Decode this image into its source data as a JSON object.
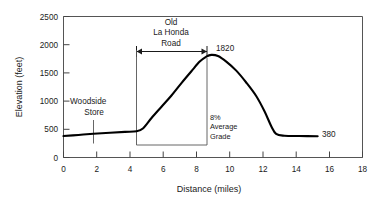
{
  "chart_data": {
    "type": "line",
    "title": "",
    "xlabel": "Distance  (miles)",
    "ylabel": "Elevation  (feet)",
    "xlim": [
      0,
      18
    ],
    "ylim": [
      0,
      2500
    ],
    "xticks": [
      "0",
      "2",
      "4",
      "6",
      "8",
      "10",
      "12",
      "14",
      "16",
      "18"
    ],
    "xtick_values": [
      0,
      2,
      4,
      6,
      8,
      10,
      12,
      14,
      16,
      18
    ],
    "yticks": [
      "0",
      "500",
      "1000",
      "1500",
      "2000",
      "2500"
    ],
    "ytick_values": [
      0,
      500,
      1000,
      1500,
      2000,
      2500
    ],
    "grid": false,
    "legend": "none",
    "series": [
      {
        "name": "Elevation profile",
        "x": [
          0.0,
          0.9,
          1.8,
          2.8,
          3.7,
          4.4,
          4.8,
          5.3,
          5.9,
          6.5,
          7.1,
          7.7,
          8.2,
          8.6,
          8.9,
          9.3,
          9.8,
          10.4,
          11.0,
          11.6,
          12.1,
          12.5,
          12.8,
          13.3,
          14.2,
          15.3
        ],
        "y": [
          380,
          400,
          420,
          440,
          455,
          465,
          520,
          700,
          900,
          1100,
          1320,
          1530,
          1700,
          1790,
          1820,
          1800,
          1700,
          1540,
          1330,
          1090,
          820,
          560,
          420,
          385,
          380,
          378
        ]
      }
    ],
    "annotations": [
      {
        "id": "peak-label",
        "text": "1820",
        "x_value": 9.3,
        "y_value": 1940
      },
      {
        "id": "end-label",
        "text": "380",
        "x_value": 15.6,
        "y_value": 560
      },
      {
        "id": "grade-label",
        "text": "8%\nAverage\nGrade",
        "line1": "8%",
        "line2": "Average",
        "line3": "Grade",
        "x_value": 8.8,
        "y_value": 700
      },
      {
        "id": "woodside-label",
        "line1": "Woodside",
        "line2": "Store",
        "x_value": 1.8,
        "y_value": 1000
      },
      {
        "id": "road-span-label",
        "line1": "Old",
        "line2": "La  Honda",
        "line3": "Road",
        "span_start_x": 4.4,
        "span_end_x": 8.7,
        "y_value": 2450
      }
    ]
  },
  "axes": {
    "x_title": "Distance  (miles)",
    "y_title": "Elevation  (feet)"
  },
  "labels": {
    "peak_elevation": "1820",
    "end_elevation": "380",
    "grade_line1": "8%",
    "grade_line2": "Average",
    "grade_line3": "Grade",
    "woodside_line1": "Woodside",
    "woodside_line2": "Store",
    "road_line1": "Old",
    "road_line2": "La  Honda",
    "road_line3": "Road"
  },
  "ticks": {
    "x": [
      "0",
      "2",
      "4",
      "6",
      "8",
      "10",
      "12",
      "14",
      "16",
      "18"
    ],
    "y": [
      "0",
      "500",
      "1000",
      "1500",
      "2000",
      "2500"
    ]
  },
  "colors": {
    "curve": "#000000",
    "frame": "#555555",
    "text": "#1a1a1a",
    "background": "#ffffff"
  }
}
